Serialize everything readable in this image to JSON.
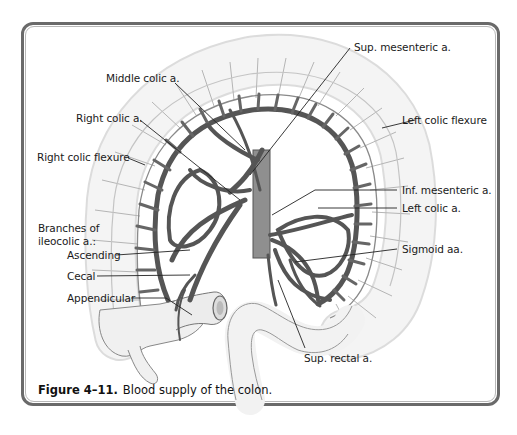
{
  "figure": {
    "number": "Figure 4–11.",
    "caption": "Blood supply of the colon."
  },
  "labels": {
    "sup_mesenteric": "Sup. mesenteric a.",
    "middle_colic": "Middle colic a.",
    "right_colic": "Right colic a.",
    "right_colic_flexure": "Right colic flexure",
    "left_colic_flexure": "Left colic flexure",
    "inf_mesenteric": "Inf. mesenteric a.",
    "left_colic": "Left colic a.",
    "branches_heading_line1": "Branches of",
    "branches_heading_line2": "ileocolic a.:",
    "ascending": "Ascending",
    "cecal": "Cecal",
    "appendicular": "Appendicular",
    "sigmoid": "Sigmoid aa.",
    "sup_rectal": "Sup. rectal a."
  },
  "colors": {
    "frame": "#6a6a6a",
    "colon_fill": "#f2f2f2",
    "colon_stroke": "#9a9a9a",
    "artery": "#555555",
    "leader": "#222222"
  }
}
